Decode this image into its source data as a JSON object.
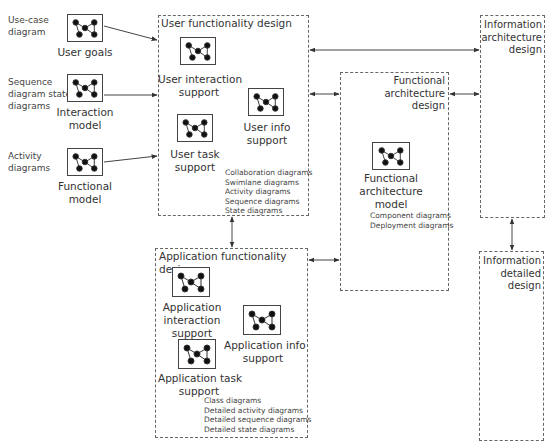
{
  "left_models": [
    {
      "source_label": "Use-case\ndiagram",
      "caption": "User goals"
    },
    {
      "source_label": "Sequence\ndiagram state\ndiagrams",
      "caption": "Interaction\nmodel"
    },
    {
      "source_label": "Activity\ndiagrams",
      "caption": "Functional\nmodel"
    }
  ],
  "user_functionality": {
    "title": "User functionality design",
    "components": [
      {
        "caption": "User interaction\nsupport"
      },
      {
        "caption": "User info\nsupport"
      },
      {
        "caption": "User task\nsupport"
      }
    ],
    "diagrams": [
      "Collaboration diagrams",
      "Swimlane diagrams",
      "Activity diagrams",
      "Sequence diagrams",
      "State diagrams"
    ]
  },
  "application_functionality": {
    "title": "Application functionality design",
    "components": [
      {
        "caption": "Application\ninteraction\nsupport"
      },
      {
        "caption": "Application info\nsupport"
      },
      {
        "caption": "Application task\nsupport"
      }
    ],
    "diagrams": [
      "Class diagrams",
      "Detailed activity diagrams",
      "Detailed sequence diagrams",
      "Detailed state diagrams"
    ]
  },
  "functional_architecture": {
    "title": "Functional\narchitecture\ndesign",
    "model_caption": "Functional\narchitecture\nmodel",
    "diagrams": [
      "Component diagrams",
      "Deployment diagrams"
    ]
  },
  "information_architecture": {
    "title": "Information\narchitecture\ndesign"
  },
  "information_detailed": {
    "title": "Information\ndetailed\ndesign"
  },
  "colors": {
    "line": "#444444",
    "dashed_border": "#666666",
    "text": "#333333"
  }
}
